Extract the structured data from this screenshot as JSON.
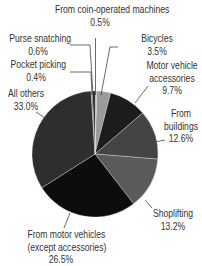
{
  "chart_data": {
    "type": "pie",
    "title": "",
    "start_angle_deg": 0,
    "direction": "clockwise",
    "center": [
      95,
      154
    ],
    "radius": 63,
    "slices": [
      {
        "label": "From coin-operated machines",
        "value": 0.5,
        "value_label": "0.5%",
        "color": "#a8a8a8"
      },
      {
        "label": "Bicycles",
        "value": 3.5,
        "value_label": "3.5%",
        "color": "#9a9a9a"
      },
      {
        "label": "Motor vehicle accessories",
        "value": 9.7,
        "value_label": "9.7%",
        "color": "#1c1c1c"
      },
      {
        "label": "From buildings",
        "value": 12.6,
        "value_label": "12.6%",
        "color": "#444444"
      },
      {
        "label": "Shoplifting",
        "value": 13.2,
        "value_label": "13.2%",
        "color": "#5a5a5a"
      },
      {
        "label": "From motor vehicles (except accessories)",
        "value": 26.5,
        "value_label": "26.5%",
        "color": "#0d0d0d"
      },
      {
        "label": "All others",
        "value": 33.0,
        "value_label": "33.0%",
        "color": "#2e2e2e"
      },
      {
        "label": "Pocket picking",
        "value": 0.4,
        "value_label": "0.4%",
        "color": "#6a6a6a"
      },
      {
        "label": "Purse snatching",
        "value": 0.6,
        "value_label": "0.6%",
        "color": "#111111"
      }
    ],
    "legend": "none (leader-line labels)"
  },
  "labels": {
    "coin": {
      "line1": "From coin-operated machines",
      "line2": "0.5%"
    },
    "bicycles": {
      "line1": "Bicycles",
      "line2": "3.5%"
    },
    "mva": {
      "line1": "Motor vehicle",
      "line2": "accessories",
      "line3": "9.7%"
    },
    "buildings": {
      "line1": "From",
      "line2": "buildings",
      "line3": "12.6%"
    },
    "shoplifting": {
      "line1": "Shoplifting",
      "line2": "13.2%"
    },
    "motor": {
      "line1": "From motor vehicles",
      "line2": "(except accessories)",
      "line3": "26.5%"
    },
    "others": {
      "line1": "All others",
      "line2": "33.0%"
    },
    "pocket": {
      "line1": "Pocket picking",
      "line2": "0.4%"
    },
    "purse": {
      "line1": "Purse snatching",
      "line2": "0.6%"
    }
  }
}
